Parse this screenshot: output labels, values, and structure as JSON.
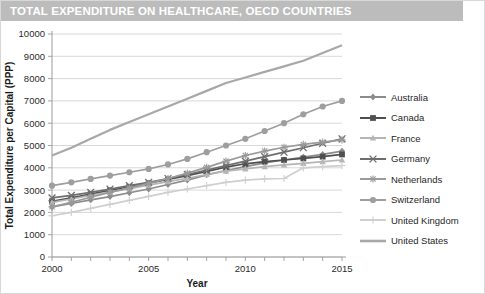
{
  "title": {
    "text": "TOTAL EXPENDITURE ON HEALTHCARE, OECD COUNTRIES",
    "banner_color": "#bcbcbc",
    "text_color": "#ffffff"
  },
  "chart_data": {
    "type": "line",
    "title": "TOTAL EXPENDITURE ON HEALTHCARE, OECD COUNTRIES",
    "xlabel": "Year",
    "ylabel": "Total Expenditure per Capital (PPP)",
    "xlim": [
      2000,
      2015
    ],
    "ylim": [
      0,
      10000
    ],
    "x": [
      2000,
      2001,
      2002,
      2003,
      2004,
      2005,
      2006,
      2007,
      2008,
      2009,
      2010,
      2011,
      2012,
      2013,
      2014,
      2015
    ],
    "xticks": [
      2000,
      2001,
      2002,
      2003,
      2004,
      2005,
      2006,
      2007,
      2008,
      2009,
      2010,
      2011,
      2012,
      2013,
      2014,
      2015
    ],
    "xtick_labels": [
      "2000",
      "",
      "",
      "",
      "",
      "2005",
      "",
      "",
      "",
      "",
      "2010",
      "",
      "",
      "",
      "",
      "2015"
    ],
    "yticks": [
      0,
      1000,
      2000,
      3000,
      4000,
      5000,
      6000,
      7000,
      8000,
      9000,
      10000
    ],
    "ytick_labels": [
      "0",
      "1000",
      "2000",
      "3000",
      "4000",
      "5000",
      "6000",
      "7000",
      "8000",
      "9000",
      "10000"
    ],
    "grid": "horizontal",
    "legend_position": "right",
    "series": [
      {
        "name": "Australia",
        "marker": "diamond",
        "color": "#8c8c8c",
        "values": [
          2250,
          2400,
          2560,
          2710,
          2880,
          3050,
          3250,
          3450,
          3680,
          3880,
          4050,
          4220,
          4350,
          4480,
          4600,
          4750
        ]
      },
      {
        "name": "Canada",
        "marker": "square",
        "color": "#4f4f4f",
        "values": [
          2500,
          2650,
          2820,
          2990,
          3150,
          3310,
          3480,
          3650,
          3840,
          4030,
          4180,
          4280,
          4350,
          4420,
          4500,
          4600
        ]
      },
      {
        "name": "France",
        "marker": "triangle",
        "color": "#b5b5b5",
        "values": [
          2450,
          2600,
          2760,
          2920,
          3070,
          3220,
          3380,
          3530,
          3700,
          3850,
          3950,
          4050,
          4130,
          4200,
          4280,
          4350
        ]
      },
      {
        "name": "Germany",
        "marker": "cross",
        "color": "#6e6e6e",
        "values": [
          2650,
          2760,
          2900,
          3050,
          3200,
          3350,
          3520,
          3700,
          3900,
          4100,
          4300,
          4500,
          4700,
          4900,
          5100,
          5300
        ]
      },
      {
        "name": "Netherlands",
        "marker": "asterisk",
        "color": "#9a9a9a",
        "values": [
          2250,
          2450,
          2680,
          2900,
          3100,
          3300,
          3520,
          3760,
          4020,
          4300,
          4550,
          4750,
          4920,
          5050,
          5150,
          5250
        ]
      },
      {
        "name": "Switzerland",
        "marker": "circle",
        "color": "#9e9e9e",
        "values": [
          3200,
          3350,
          3500,
          3650,
          3800,
          3950,
          4150,
          4400,
          4700,
          5000,
          5300,
          5650,
          6000,
          6400,
          6750,
          7000
        ]
      },
      {
        "name": "United Kingdom",
        "marker": "plus",
        "color": "#cfcfcf",
        "values": [
          1850,
          2000,
          2180,
          2360,
          2540,
          2720,
          2900,
          3050,
          3200,
          3350,
          3450,
          3500,
          3520,
          4000,
          4050,
          4100
        ]
      },
      {
        "name": "United States",
        "marker": "none",
        "color": "#a8a8a8",
        "values": [
          4550,
          4900,
          5300,
          5700,
          6050,
          6400,
          6750,
          7100,
          7450,
          7800,
          8050,
          8300,
          8550,
          8800,
          9150,
          9500
        ]
      }
    ]
  }
}
